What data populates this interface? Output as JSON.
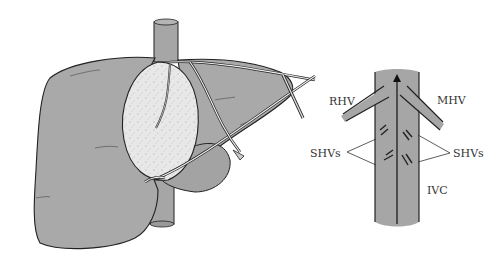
{
  "figure": {
    "type": "medical-illustration",
    "panels": [
      {
        "id": "liver-view",
        "description": "liver with transected parenchyma, IVC and encircling tapes"
      },
      {
        "id": "ivc-schematic",
        "description": "schematic of inferior vena cava with hepatic veins"
      }
    ],
    "labels": {
      "rhv": "RHV",
      "mhv": "MHV",
      "shvs_left": "SHVs",
      "shvs_right": "SHVs",
      "ivc": "IVC"
    },
    "colors": {
      "liver_fill": "#a9a9a9",
      "cut_surface": "#e6e6e6",
      "vessel_fill": "#a6a6a6",
      "outline": "#222222",
      "background": "#ffffff"
    }
  }
}
